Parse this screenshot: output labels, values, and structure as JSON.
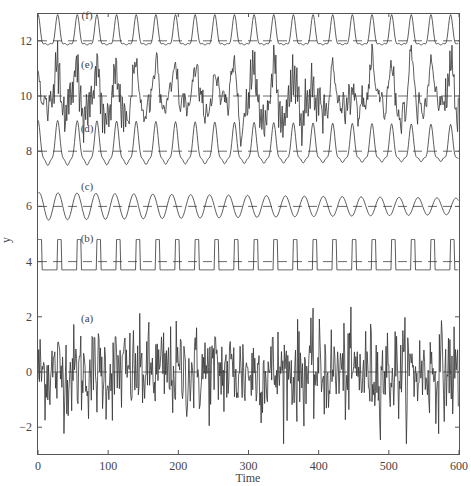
{
  "chart_data": {
    "type": "line",
    "title": "",
    "xlabel": "Time",
    "ylabel": "y",
    "xlim": [
      0,
      600
    ],
    "ylim": [
      -3,
      13
    ],
    "x_ticks": [
      0,
      100,
      200,
      300,
      400,
      500,
      600
    ],
    "x_tick_labels": [
      "0",
      "100",
      "200",
      "300",
      "400",
      "500",
      "600"
    ],
    "y_ticks": [
      -2,
      0,
      2,
      4,
      6,
      8,
      10,
      12
    ],
    "y_tick_labels": [
      "−2",
      "0",
      "2",
      "4",
      "6",
      "8",
      "10",
      "12"
    ],
    "grid": false,
    "legend": "none (inline labels)",
    "n_points": 600,
    "series": [
      {
        "name": "(a)",
        "label": "(a)",
        "offset": 0,
        "kind": "white noise",
        "amplitude_range": [
          -2.6,
          3.3
        ],
        "label_pos": [
          70,
          1.8
        ]
      },
      {
        "name": "(b)",
        "label": "(b)",
        "offset": 4,
        "kind": "square pulse train",
        "high": 4.8,
        "low": 3.7,
        "period": 28,
        "duty": 0.2,
        "label_pos": [
          70,
          4.7
        ]
      },
      {
        "name": "(c)",
        "label": "(c)",
        "offset": 6,
        "kind": "sinusoid",
        "period": 27,
        "amplitude": 0.35,
        "label_pos": [
          70,
          6.6
        ]
      },
      {
        "name": "(d)",
        "label": "(d)",
        "offset": 8,
        "kind": "periodic with harmonics",
        "period": 28,
        "range": [
          7.5,
          9.0
        ],
        "label_pos": [
          70,
          8.7
        ]
      },
      {
        "name": "(e)",
        "label": "(e)",
        "offset": 10,
        "kind": "quasi-periodic chaotic",
        "range": [
          8.8,
          11.5
        ],
        "label_pos": [
          70,
          11.0
        ]
      },
      {
        "name": "(f)",
        "label": "(f)",
        "offset": 12,
        "kind": "periodic with harmonics",
        "period": 28,
        "range": [
          11.6,
          12.9
        ],
        "label_pos": [
          70,
          12.8
        ]
      }
    ],
    "reference_lines": [
      {
        "y": 0,
        "style": "dashed"
      },
      {
        "y": 4,
        "style": "dashed"
      },
      {
        "y": 6,
        "style": "dashed"
      },
      {
        "y": 8,
        "style": "dashed"
      },
      {
        "y": 10,
        "style": "dashed"
      },
      {
        "y": 12,
        "style": "dashed"
      }
    ]
  },
  "colors": {
    "line": "#333333",
    "axis": "#555555",
    "background": "#ffffff"
  }
}
